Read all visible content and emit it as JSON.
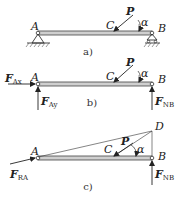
{
  "diagram": {
    "subfigures": [
      {
        "caption": "a)",
        "points": {
          "A": "A",
          "B": "B",
          "C": "C"
        },
        "load": {
          "label": "P",
          "angle": "α"
        },
        "supports": {
          "A": "pin",
          "B": "roller"
        }
      },
      {
        "caption": "b)",
        "points": {
          "A": "A",
          "B": "B",
          "C": "C"
        },
        "load": {
          "label": "P",
          "angle": "α"
        },
        "forces": {
          "Ax": {
            "main": "F",
            "sub": "Ax"
          },
          "Ay": {
            "main": "F",
            "sub": "Ay"
          },
          "NB": {
            "main": "F",
            "sub": "NB"
          }
        }
      },
      {
        "caption": "c)",
        "points": {
          "A": "A",
          "B": "B",
          "C": "C",
          "D": "D"
        },
        "load": {
          "label": "P",
          "angle": "α"
        },
        "forces": {
          "RA": {
            "main": "F",
            "sub": "RA"
          },
          "NB": {
            "main": "F",
            "sub": "NB"
          }
        }
      }
    ]
  }
}
